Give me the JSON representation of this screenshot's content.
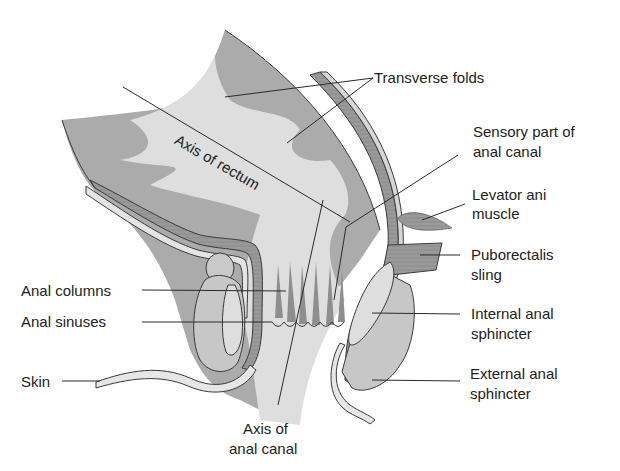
{
  "diagram": {
    "colors": {
      "background": "#ffffff",
      "mucosa_dark": "#a9a9a9",
      "mucosa_light": "#dcdcdc",
      "muscle_wall": "#8e8e8e",
      "sphincter_fill": "#c9c9c9",
      "outline": "#3a3a3a",
      "label_text": "#222222"
    },
    "labels": {
      "transverse_folds": "Transverse folds",
      "axis_of_rectum": "Axis of rectum",
      "sensory_line1": "Sensory part of",
      "sensory_line2": "anal canal",
      "levator_line1": "Levator ani",
      "levator_line2": "muscle",
      "puborectalis_line1": "Puborectalis",
      "puborectalis_line2": "sling",
      "anal_columns": "Anal columns",
      "anal_sinuses": "Anal sinuses",
      "internal_line1": "Internal anal",
      "internal_line2": "sphincter",
      "skin": "Skin",
      "external_line1": "External anal",
      "external_line2": "sphincter",
      "axis_canal_line1": "Axis of",
      "axis_canal_line2": "anal canal"
    }
  }
}
